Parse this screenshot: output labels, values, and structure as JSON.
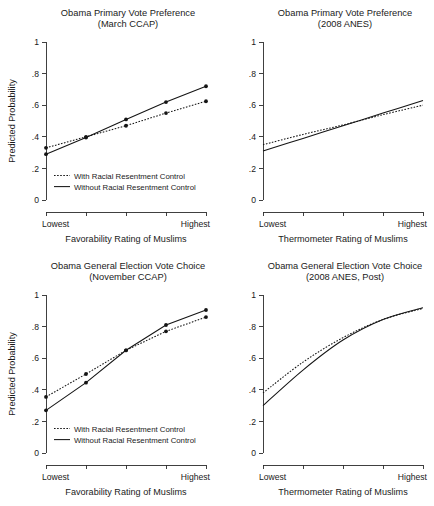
{
  "figure": {
    "ylabel": "Predicted Probability",
    "yticks": [
      "0",
      ".2",
      ".4",
      ".6",
      ".8",
      "1"
    ],
    "ytickvals": [
      0,
      0.2,
      0.4,
      0.6,
      0.8,
      1
    ],
    "x_low_label": "Lowest",
    "x_high_label": "Highest",
    "legend": {
      "with_label": "With Racial Resentment Control",
      "without_label": "Without Racial Resentment Control"
    }
  },
  "chart_data": [
    {
      "type": "line",
      "panel": "top-left",
      "title": "Obama Primary Vote Preference",
      "subtitle": "(March CCAP)",
      "xlabel": "Favorability Rating of Muslims",
      "ylabel": "Predicted Probability",
      "ylim": [
        0,
        1
      ],
      "yticks": [
        0,
        0.2,
        0.4,
        0.6,
        0.8,
        1
      ],
      "xtick_labels": [
        "Lowest",
        "",
        "",
        "",
        "Highest"
      ],
      "x": [
        1,
        2,
        3,
        4,
        5
      ],
      "grid": false,
      "markers": true,
      "legend_position": "lower-left",
      "series": [
        {
          "name": "With Racial Resentment Control",
          "style": "dotted",
          "values": [
            0.33,
            0.4,
            0.47,
            0.55,
            0.625
          ]
        },
        {
          "name": "Without Racial Resentment Control",
          "style": "solid",
          "values": [
            0.29,
            0.395,
            0.51,
            0.62,
            0.72
          ]
        }
      ]
    },
    {
      "type": "line",
      "panel": "top-right",
      "title": "Obama Primary Vote Preference",
      "subtitle": "(2008 ANES)",
      "xlabel": "Thermometer Rating of Muslims",
      "ylabel": "",
      "ylim": [
        0,
        1
      ],
      "yticks": [
        0,
        0.2,
        0.4,
        0.6,
        0.8,
        1
      ],
      "xtick_labels": [
        "Lowest",
        "",
        "",
        "",
        "Highest"
      ],
      "x": [
        1,
        2,
        3,
        4,
        5
      ],
      "grid": false,
      "markers": false,
      "legend_position": "none",
      "series": [
        {
          "name": "With Racial Resentment Control",
          "style": "dotted",
          "values": [
            0.35,
            0.415,
            0.475,
            0.54,
            0.6
          ]
        },
        {
          "name": "Without Racial Resentment Control",
          "style": "solid",
          "values": [
            0.31,
            0.39,
            0.47,
            0.55,
            0.63
          ]
        }
      ]
    },
    {
      "type": "line",
      "panel": "bottom-left",
      "title": "Obama General Election Vote Choice",
      "subtitle": "(November CCAP)",
      "xlabel": "Favorability Rating of Muslims",
      "ylabel": "Predicted Probability",
      "ylim": [
        0,
        1
      ],
      "yticks": [
        0,
        0.2,
        0.4,
        0.6,
        0.8,
        1
      ],
      "xtick_labels": [
        "Lowest",
        "",
        "",
        "",
        "Highest"
      ],
      "x": [
        1,
        2,
        3,
        4,
        5
      ],
      "grid": false,
      "markers": true,
      "legend_position": "lower-left",
      "series": [
        {
          "name": "With Racial Resentment Control",
          "style": "dotted",
          "values": [
            0.355,
            0.5,
            0.65,
            0.77,
            0.86
          ]
        },
        {
          "name": "Without Racial Resentment Control",
          "style": "solid",
          "values": [
            0.27,
            0.445,
            0.65,
            0.81,
            0.905
          ]
        }
      ]
    },
    {
      "type": "line",
      "panel": "bottom-right",
      "title": "Obama General Election Vote Choice",
      "subtitle": "(2008 ANES, Post)",
      "xlabel": "Thermometer Rating of Muslims",
      "ylabel": "",
      "ylim": [
        0,
        1
      ],
      "yticks": [
        0,
        0.2,
        0.4,
        0.6,
        0.8,
        1
      ],
      "xtick_labels": [
        "Lowest",
        "",
        "",
        "",
        "Highest"
      ],
      "x": [
        1,
        2,
        3,
        4,
        5
      ],
      "grid": false,
      "markers": false,
      "legend_position": "none",
      "series": [
        {
          "name": "With Racial Resentment Control",
          "style": "dotted",
          "values": [
            0.38,
            0.575,
            0.73,
            0.845,
            0.915
          ]
        },
        {
          "name": "Without Racial Resentment Control",
          "style": "solid",
          "values": [
            0.3,
            0.525,
            0.715,
            0.845,
            0.92
          ]
        }
      ]
    }
  ]
}
